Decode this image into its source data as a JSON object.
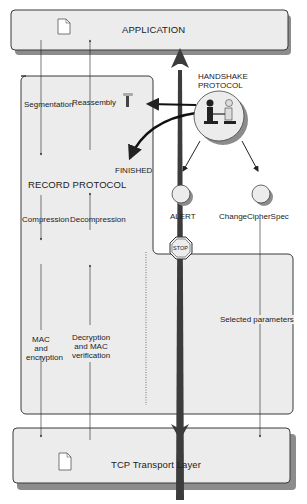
{
  "diagram": {
    "application": {
      "label": "APPLICATION"
    },
    "transport": {
      "label": "TCP Transport Layer"
    },
    "record_protocol": {
      "title": "RECORD PROTOCOL",
      "steps_down": [
        "Segmentation",
        "Compression",
        "MAC and\nencryption"
      ],
      "steps_up": [
        "Reassembly",
        "Decompression",
        "Decryption\nand MAC\nverification"
      ]
    },
    "handshake": {
      "title_line1": "HANDSHAKE",
      "title_line2": "PROTOCOL"
    },
    "finished": {
      "label": "FINISHED"
    },
    "alert": {
      "label": "ALERT",
      "stop_label": "STOP"
    },
    "change_cipher_spec": {
      "label": "ChangeCipherSpec"
    },
    "selected_parameters": {
      "label": "Selected parameters"
    }
  },
  "colors": {
    "box_fill": "#ececec",
    "box_stroke": "#3a3a3a",
    "shadow": "#8c8c8c",
    "arrow_dark": "#3c3c3c"
  }
}
